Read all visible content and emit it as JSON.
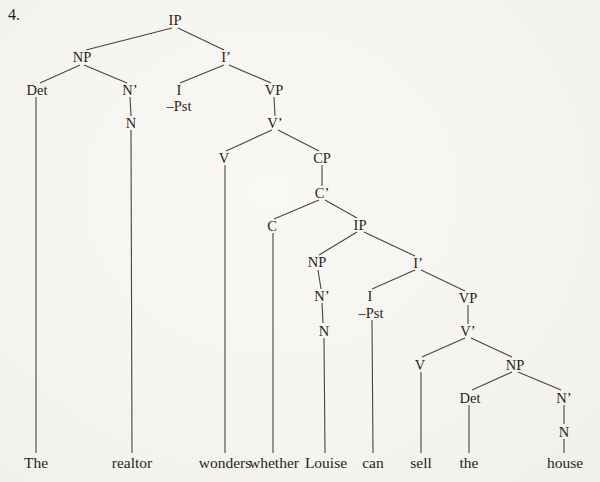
{
  "page": {
    "item_number": "4.",
    "background_color": "#f7f5f0",
    "text_color": "#241f1a",
    "line_color": "#4a443c"
  },
  "tree": {
    "sentence": "The realtor wonders whether Louise can sell the house",
    "nodes": [
      {
        "id": "ip-main",
        "label": "IP",
        "x": 175,
        "y": 20
      },
      {
        "id": "np-subject",
        "label": "NP",
        "x": 82,
        "y": 57
      },
      {
        "id": "i-bar-main",
        "label": "I’",
        "x": 226,
        "y": 57
      },
      {
        "id": "det-subject",
        "label": "Det",
        "x": 37,
        "y": 90
      },
      {
        "id": "n-bar-subject",
        "label": "N’",
        "x": 130,
        "y": 90
      },
      {
        "id": "i-main",
        "label": "I",
        "x": 179,
        "y": 90
      },
      {
        "id": "pst-main",
        "label": "–Pst",
        "x": 179,
        "y": 106
      },
      {
        "id": "vp-main",
        "label": "VP",
        "x": 274,
        "y": 90
      },
      {
        "id": "n-subject",
        "label": "N",
        "x": 131,
        "y": 123
      },
      {
        "id": "v-bar-main",
        "label": "V’",
        "x": 275,
        "y": 123
      },
      {
        "id": "v-main",
        "label": "V",
        "x": 224,
        "y": 158
      },
      {
        "id": "cp",
        "label": "CP",
        "x": 322,
        "y": 158
      },
      {
        "id": "c-bar",
        "label": "C’",
        "x": 322,
        "y": 193
      },
      {
        "id": "c",
        "label": "C",
        "x": 272,
        "y": 226
      },
      {
        "id": "ip-embedded",
        "label": "IP",
        "x": 360,
        "y": 225
      },
      {
        "id": "np-embedded-subject",
        "label": "NP",
        "x": 317,
        "y": 262
      },
      {
        "id": "i-bar-embedded",
        "label": "I’",
        "x": 418,
        "y": 263
      },
      {
        "id": "n-bar-embedded",
        "label": "N’",
        "x": 322,
        "y": 296
      },
      {
        "id": "i-embedded",
        "label": "I",
        "x": 370,
        "y": 296
      },
      {
        "id": "pst-embedded",
        "label": "–Pst",
        "x": 371,
        "y": 313
      },
      {
        "id": "vp-embedded",
        "label": "VP",
        "x": 468,
        "y": 298
      },
      {
        "id": "n-embedded",
        "label": "N",
        "x": 324,
        "y": 331
      },
      {
        "id": "v-bar-embedded",
        "label": "V’",
        "x": 468,
        "y": 331
      },
      {
        "id": "v-embedded",
        "label": "V",
        "x": 420,
        "y": 365
      },
      {
        "id": "np-object",
        "label": "NP",
        "x": 515,
        "y": 365
      },
      {
        "id": "det-object",
        "label": "Det",
        "x": 470,
        "y": 398
      },
      {
        "id": "n-bar-object",
        "label": "N’",
        "x": 564,
        "y": 398
      },
      {
        "id": "n-object",
        "label": "N",
        "x": 564,
        "y": 432
      }
    ],
    "leaves": [
      {
        "id": "word-the-1",
        "label": "The",
        "x": 36,
        "y": 463
      },
      {
        "id": "word-realtor",
        "label": "realtor",
        "x": 132,
        "y": 463
      },
      {
        "id": "word-wonders",
        "label": "wonders",
        "x": 225,
        "y": 463
      },
      {
        "id": "word-whether",
        "label": "whether",
        "x": 274,
        "y": 463
      },
      {
        "id": "word-louise",
        "label": "Louise",
        "x": 326,
        "y": 463
      },
      {
        "id": "word-can",
        "label": "can",
        "x": 373,
        "y": 463
      },
      {
        "id": "word-sell",
        "label": "sell",
        "x": 421,
        "y": 463
      },
      {
        "id": "word-the-2",
        "label": "the",
        "x": 469,
        "y": 463
      },
      {
        "id": "word-house",
        "label": "house",
        "x": 565,
        "y": 463
      }
    ],
    "edges": [
      {
        "from": "ip-main",
        "to": "np-subject",
        "x1": 172,
        "y1": 28,
        "x2": 86,
        "y2": 50
      },
      {
        "from": "ip-main",
        "to": "i-bar-main",
        "x1": 178,
        "y1": 28,
        "x2": 224,
        "y2": 50
      },
      {
        "from": "np-subject",
        "to": "det-subject",
        "x1": 80,
        "y1": 65,
        "x2": 40,
        "y2": 83
      },
      {
        "from": "np-subject",
        "to": "n-bar-subject",
        "x1": 84,
        "y1": 65,
        "x2": 127,
        "y2": 83
      },
      {
        "from": "i-bar-main",
        "to": "i-main",
        "x1": 224,
        "y1": 65,
        "x2": 180,
        "y2": 83
      },
      {
        "from": "i-bar-main",
        "to": "vp-main",
        "x1": 229,
        "y1": 65,
        "x2": 271,
        "y2": 83
      },
      {
        "from": "det-subject",
        "to": "word-the-1",
        "x1": 36,
        "y1": 97,
        "x2": 36,
        "y2": 453
      },
      {
        "from": "n-bar-subject",
        "to": "n-subject",
        "x1": 130,
        "y1": 97,
        "x2": 131,
        "y2": 116
      },
      {
        "from": "n-subject",
        "to": "word-realtor",
        "x1": 131,
        "y1": 130,
        "x2": 132,
        "y2": 453
      },
      {
        "from": "vp-main",
        "to": "v-bar-main",
        "x1": 274,
        "y1": 97,
        "x2": 275,
        "y2": 116
      },
      {
        "from": "v-bar-main",
        "to": "v-main",
        "x1": 272,
        "y1": 130,
        "x2": 226,
        "y2": 151
      },
      {
        "from": "v-bar-main",
        "to": "cp",
        "x1": 278,
        "y1": 130,
        "x2": 319,
        "y2": 151
      },
      {
        "from": "v-main",
        "to": "word-wonders",
        "x1": 225,
        "y1": 165,
        "x2": 225,
        "y2": 453
      },
      {
        "from": "cp",
        "to": "c-bar",
        "x1": 322,
        "y1": 165,
        "x2": 322,
        "y2": 186
      },
      {
        "from": "c-bar",
        "to": "c",
        "x1": 319,
        "y1": 200,
        "x2": 274,
        "y2": 219
      },
      {
        "from": "c-bar",
        "to": "ip-embedded",
        "x1": 325,
        "y1": 200,
        "x2": 357,
        "y2": 218
      },
      {
        "from": "c",
        "to": "word-whether",
        "x1": 273,
        "y1": 233,
        "x2": 273,
        "y2": 453
      },
      {
        "from": "ip-embedded",
        "to": "np-embedded-subject",
        "x1": 357,
        "y1": 232,
        "x2": 319,
        "y2": 255
      },
      {
        "from": "ip-embedded",
        "to": "i-bar-embedded",
        "x1": 364,
        "y1": 232,
        "x2": 415,
        "y2": 256
      },
      {
        "from": "np-embedded-subject",
        "to": "n-bar-embedded",
        "x1": 318,
        "y1": 270,
        "x2": 321,
        "y2": 289
      },
      {
        "from": "n-bar-embedded",
        "to": "n-embedded",
        "x1": 322,
        "y1": 303,
        "x2": 323,
        "y2": 323
      },
      {
        "from": "n-embedded",
        "to": "word-louise",
        "x1": 324,
        "y1": 338,
        "x2": 325,
        "y2": 453
      },
      {
        "from": "i-bar-embedded",
        "to": "i-embedded",
        "x1": 415,
        "y1": 270,
        "x2": 372,
        "y2": 289
      },
      {
        "from": "i-bar-embedded",
        "to": "vp-embedded",
        "x1": 421,
        "y1": 270,
        "x2": 465,
        "y2": 291
      },
      {
        "from": "pst-embedded",
        "to": "word-can",
        "x1": 372,
        "y1": 320,
        "x2": 373,
        "y2": 453
      },
      {
        "from": "vp-embedded",
        "to": "v-bar-embedded",
        "x1": 468,
        "y1": 305,
        "x2": 468,
        "y2": 324
      },
      {
        "from": "v-bar-embedded",
        "to": "v-embedded",
        "x1": 465,
        "y1": 338,
        "x2": 422,
        "y2": 357
      },
      {
        "from": "v-bar-embedded",
        "to": "np-object",
        "x1": 471,
        "y1": 338,
        "x2": 512,
        "y2": 357
      },
      {
        "from": "v-embedded",
        "to": "word-sell",
        "x1": 421,
        "y1": 372,
        "x2": 421,
        "y2": 453
      },
      {
        "from": "np-object",
        "to": "det-object",
        "x1": 512,
        "y1": 372,
        "x2": 472,
        "y2": 390
      },
      {
        "from": "np-object",
        "to": "n-bar-object",
        "x1": 518,
        "y1": 372,
        "x2": 561,
        "y2": 390
      },
      {
        "from": "det-object",
        "to": "word-the-2",
        "x1": 469,
        "y1": 405,
        "x2": 469,
        "y2": 453
      },
      {
        "from": "n-bar-object",
        "to": "n-object",
        "x1": 564,
        "y1": 405,
        "x2": 564,
        "y2": 424
      },
      {
        "from": "n-object",
        "to": "word-house",
        "x1": 564,
        "y1": 439,
        "x2": 564,
        "y2": 453
      }
    ]
  }
}
